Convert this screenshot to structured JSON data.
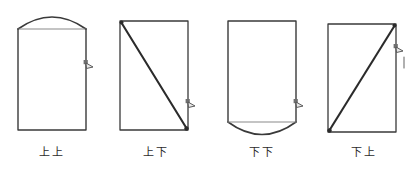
{
  "figure": {
    "background_color": "#ffffff",
    "stroke_color": "#3a3a3a",
    "accent_stroke_color": "#2b2b2b",
    "caption_color": "#2b2b2b",
    "items": [
      {
        "id": "shang-shang",
        "caption": "上上",
        "shape": "rectangle-with-top-arc",
        "marker": "arrow-marker-right-upper"
      },
      {
        "id": "shang-xia",
        "caption": "上下",
        "shape": "rectangle-with-diagonal-topleft-to-bottomright",
        "marker": "arrow-marker-right-lower"
      },
      {
        "id": "xia-xia",
        "caption": "下下",
        "shape": "rectangle-with-bottom-arc",
        "marker": "arrow-marker-right-lower"
      },
      {
        "id": "xia-shang",
        "caption": "下上",
        "shape": "rectangle-with-diagonal-bottomleft-to-topright",
        "marker": "arrow-marker-right-upper-with-tick"
      }
    ]
  }
}
